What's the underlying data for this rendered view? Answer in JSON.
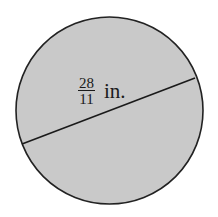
{
  "diagram": {
    "shape": "circle",
    "fill_color": "#c9c9c9",
    "stroke_color": "#222222",
    "circle": {
      "cx": 109.5,
      "cy": 110.5,
      "r": 93.5
    },
    "diameter_line": {
      "x1": 22,
      "y1": 144,
      "x2": 195,
      "y2": 78
    },
    "label": {
      "numerator": "28",
      "denominator": "11",
      "unit": "in."
    }
  }
}
